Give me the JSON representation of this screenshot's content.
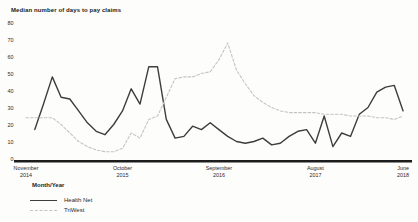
{
  "title": "Median number of days to pay claims",
  "colors": {
    "health_net_line": "#3d3d3d",
    "triwest_line": "#c4c4c4",
    "axis_line": "#1c1c1c",
    "text": "#2a2a2a",
    "background": "#fdfdfc"
  },
  "legend": {
    "title": "Month/Year",
    "items": [
      {
        "name": "Health Net",
        "style": "solid"
      },
      {
        "name": "TriWest",
        "style": "dashed"
      }
    ]
  },
  "chart_data": {
    "type": "line",
    "title": "Median number of days to pay claims",
    "xlabel": "Month/Year",
    "ylabel": "",
    "ylim": [
      0,
      80
    ],
    "grid": false,
    "legend_position": "bottom-left",
    "y_ticks": [
      0,
      10,
      20,
      30,
      40,
      50,
      60,
      70,
      80
    ],
    "x": [
      "Nov 2014",
      "Dec 2014",
      "Jan 2015",
      "Feb 2015",
      "Mar 2015",
      "Apr 2015",
      "May 2015",
      "Jun 2015",
      "Jul 2015",
      "Aug 2015",
      "Sep 2015",
      "Oct 2015",
      "Nov 2015",
      "Dec 2015",
      "Jan 2016",
      "Feb 2016",
      "Mar 2016",
      "Apr 2016",
      "May 2016",
      "Jun 2016",
      "Jul 2016",
      "Aug 2016",
      "Sep 2016",
      "Oct 2016",
      "Nov 2016",
      "Dec 2016",
      "Jan 2017",
      "Feb 2017",
      "Mar 2017",
      "Apr 2017",
      "May 2017",
      "Jun 2017",
      "Jul 2017",
      "Aug 2017",
      "Sep 2017",
      "Oct 2017",
      "Nov 2017",
      "Dec 2017",
      "Jan 2018",
      "Feb 2018",
      "Mar 2018",
      "Apr 2018",
      "May 2018",
      "Jun 2018"
    ],
    "x_ticks": [
      {
        "index": 0,
        "line1": "November",
        "line2": "2014"
      },
      {
        "index": 11,
        "line1": "October",
        "line2": "2015"
      },
      {
        "index": 22,
        "line1": "September",
        "line2": "2016"
      },
      {
        "index": 33,
        "line1": "August",
        "line2": "2017"
      },
      {
        "index": 43,
        "line1": "June",
        "line2": "2018"
      }
    ],
    "series": [
      {
        "name": "Health Net",
        "style": "solid",
        "color": "#3d3d3d",
        "values": [
          null,
          17,
          32,
          48,
          36,
          35,
          28,
          21,
          16,
          14,
          20,
          28,
          41,
          32,
          54,
          54,
          23,
          12,
          13,
          19,
          17,
          21,
          17,
          13,
          10,
          9,
          10,
          12,
          8,
          9,
          13,
          16,
          17,
          9,
          25,
          7,
          15,
          13,
          26,
          30,
          39,
          42,
          43,
          28
        ]
      },
      {
        "name": "TriWest",
        "style": "dashed",
        "color": "#c4c4c4",
        "values": [
          24,
          24,
          24,
          24,
          20,
          15,
          10,
          7,
          5,
          4,
          4,
          6,
          15,
          12,
          23,
          25,
          36,
          47,
          48,
          48,
          50,
          51,
          58,
          68,
          52,
          44,
          37,
          33,
          30,
          28,
          27,
          27,
          27,
          27,
          26,
          26,
          26,
          25,
          25,
          25,
          24,
          24,
          23,
          25
        ]
      }
    ]
  }
}
